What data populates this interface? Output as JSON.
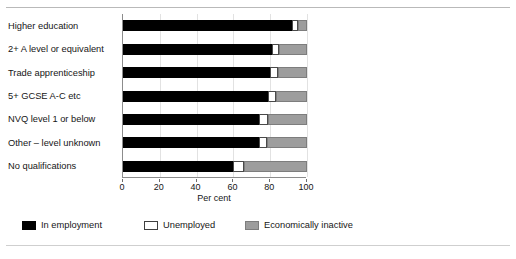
{
  "chart_data": {
    "type": "bar",
    "orientation": "horizontal",
    "stacked": true,
    "title": "",
    "xlabel": "Per cent",
    "ylabel": "",
    "xlim": [
      0,
      100
    ],
    "xticks": [
      0,
      20,
      40,
      60,
      80,
      100
    ],
    "xticklabels": [
      "0",
      "20",
      "40",
      "60",
      "80",
      "100"
    ],
    "grid": true,
    "legend_position": "bottom",
    "categories": [
      "Higher education",
      "2+ A level or equivalent",
      "Trade apprenticeship",
      "5+ GCSE A-C etc",
      "NVQ level 1 or below",
      "Other – level unknown",
      "No qualifications"
    ],
    "series": [
      {
        "name": "In employment",
        "color": "#000000",
        "values": [
          92,
          81,
          80,
          79,
          74,
          74,
          60
        ]
      },
      {
        "name": "Unemployed",
        "color": "#ffffff",
        "values": [
          3,
          4,
          4,
          4,
          5,
          4,
          6
        ]
      },
      {
        "name": "Economically inactive",
        "color": "#9d9d9d",
        "values": [
          5,
          15,
          16,
          17,
          21,
          22,
          34
        ]
      }
    ]
  },
  "legend": {
    "items": [
      {
        "label": "In employment",
        "swatch": "employment"
      },
      {
        "label": "Unemployed",
        "swatch": "unemployed"
      },
      {
        "label": "Economically inactive",
        "swatch": "inactive"
      }
    ]
  }
}
